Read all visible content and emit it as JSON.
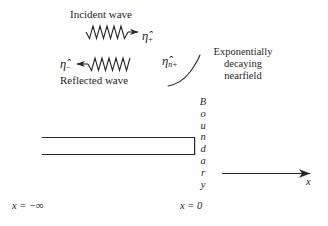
{
  "figure": {
    "title_incident": "Incident wave",
    "title_reflected": "Reflected wave",
    "nearfield_line1": "Exponentially",
    "nearfield_line2": "decaying",
    "nearfield_line3": "nearfield",
    "eta_symbol": "η̂",
    "eta_plus_sub": "+",
    "eta_minus_sub": "−",
    "eta_near_sub": "n+",
    "boundary_word": "Boundary",
    "boundary_letters": [
      "B",
      "o",
      "u",
      "n",
      "d",
      "a",
      "r",
      "y"
    ],
    "x_minus_infinity": "x = −∞",
    "x_zero": "x = 0",
    "x_axis_label": "x",
    "line_color": "#262626",
    "background_color": "#ffffff",
    "wave_incident_cycles": 6,
    "wave_reflected_cycles": 6,
    "incident_direction": "right",
    "reflected_direction": "left"
  }
}
